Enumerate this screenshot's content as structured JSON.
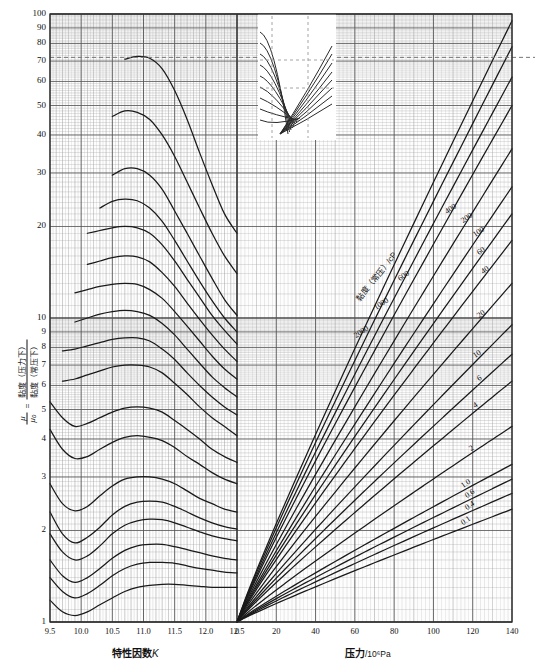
{
  "figure": {
    "kind": "nomograph",
    "background": "#ffffff",
    "grid_color": "#9a9a9a",
    "major_grid_color": "#555555",
    "curve_color": "#1a1a1a",
    "dashed_color": "#777777"
  },
  "axes": {
    "y": {
      "title_mu": "μ",
      "title_mu0": "μ₀",
      "title_num": "黏度（压力下）",
      "title_den": "黏度（常压下）",
      "scale": "log",
      "min": 1,
      "max": 100,
      "ticks": [
        "1",
        "2",
        "3",
        "4",
        "5",
        "6",
        "7",
        "8",
        "9",
        "10",
        "20",
        "30",
        "40",
        "50",
        "60",
        "70",
        "80",
        "90",
        "100"
      ]
    },
    "x_left": {
      "title": "特性因数",
      "title_symbol": "K",
      "scale": "linear",
      "min": 9.5,
      "max": 12.5,
      "ticks": [
        "9.5",
        "10.0",
        "10.5",
        "11.0",
        "11.5",
        "12.0",
        "12.5"
      ]
    },
    "x_right": {
      "title": "压力",
      "title_unit": "/10⁶Pa",
      "scale": "linear",
      "min": 0,
      "max": 140,
      "ticks": [
        "0",
        "20",
        "40",
        "60",
        "80",
        "100",
        "120",
        "140"
      ]
    }
  },
  "annotations": {
    "right_panel_family_label": "黏度（常压）/cP",
    "guide_line_value": "72"
  },
  "chart_data": {
    "type": "line",
    "title": "",
    "xlabel": "特性因数K  |  压力/10⁶Pa",
    "ylabel": "μ/μ₀ = 黏度（压力下）/黏度（常压下）",
    "ylim": [
      1,
      100
    ],
    "grid": true,
    "legend_position": "inline-curve-labels",
    "panels": [
      {
        "name": "left-panel-characterization-factor",
        "xlabel": "特性因数K",
        "xlim": [
          9.5,
          12.5
        ],
        "x": [
          9.5,
          9.7,
          9.9,
          10.1,
          10.3,
          10.5,
          10.7,
          10.9,
          11.1,
          11.3,
          11.5,
          11.7,
          11.9,
          12.1,
          12.3,
          12.5
        ],
        "series": [
          {
            "name": "c1",
            "values": [
              null,
              null,
              null,
              null,
              null,
              null,
              71.0,
              72.5,
              71.5,
              66.0,
              56.0,
              45.0,
              35.0,
              27.5,
              22.0,
              19.0
            ]
          },
          {
            "name": "c2",
            "values": [
              null,
              null,
              null,
              null,
              null,
              46.0,
              48.0,
              47.5,
              45.0,
              40.0,
              34.0,
              28.0,
              23.0,
              19.0,
              16.0,
              14.0
            ]
          },
          {
            "name": "c3",
            "values": [
              null,
              null,
              null,
              null,
              null,
              29.5,
              31.0,
              31.0,
              29.5,
              26.5,
              22.5,
              19.0,
              16.0,
              13.5,
              11.5,
              10.2
            ]
          },
          {
            "name": "c4",
            "values": [
              null,
              null,
              null,
              null,
              23.0,
              24.2,
              24.6,
              24.3,
              23.0,
              20.8,
              18.0,
              15.4,
              13.2,
              11.4,
              10.0,
              9.0
            ]
          },
          {
            "name": "c5",
            "values": [
              null,
              null,
              null,
              19.0,
              19.4,
              19.8,
              20.0,
              19.8,
              19.0,
              17.4,
              15.4,
              13.4,
              11.7,
              10.2,
              9.1,
              8.2
            ]
          },
          {
            "name": "c6",
            "values": [
              null,
              null,
              null,
              15.0,
              15.4,
              15.8,
              16.0,
              15.9,
              15.3,
              14.1,
              12.7,
              11.2,
              9.9,
              8.8,
              7.9,
              7.2
            ]
          },
          {
            "name": "c7",
            "values": [
              null,
              null,
              12.1,
              12.4,
              12.7,
              12.9,
              13.0,
              12.9,
              12.4,
              11.6,
              10.5,
              9.4,
              8.4,
              7.5,
              6.8,
              6.3
            ]
          },
          {
            "name": "c8",
            "values": [
              null,
              null,
              9.7,
              10.0,
              10.3,
              10.5,
              10.6,
              10.5,
              10.2,
              9.6,
              8.8,
              7.9,
              7.1,
              6.4,
              5.9,
              5.5
            ]
          },
          {
            "name": "c9",
            "values": [
              null,
              7.8,
              7.9,
              8.1,
              8.3,
              8.5,
              8.6,
              8.6,
              8.4,
              7.9,
              7.3,
              6.6,
              6.0,
              5.5,
              5.1,
              4.8
            ]
          },
          {
            "name": "c10",
            "values": [
              null,
              6.2,
              6.3,
              6.5,
              6.7,
              6.9,
              7.0,
              7.0,
              6.9,
              6.6,
              6.1,
              5.6,
              5.1,
              4.7,
              4.4,
              4.1
            ]
          },
          {
            "name": "c11",
            "values": [
              5.3,
              4.7,
              4.4,
              4.5,
              4.7,
              4.9,
              5.05,
              5.1,
              5.05,
              4.9,
              4.6,
              4.3,
              4.0,
              3.7,
              3.5,
              3.35
            ]
          },
          {
            "name": "c12",
            "values": [
              4.3,
              3.7,
              3.45,
              3.5,
              3.7,
              3.9,
              4.05,
              4.1,
              4.05,
              3.95,
              3.75,
              3.5,
              3.3,
              3.1,
              2.95,
              2.85
            ]
          },
          {
            "name": "c13",
            "values": [
              2.85,
              2.45,
              2.32,
              2.4,
              2.6,
              2.8,
              2.95,
              3.0,
              3.0,
              2.95,
              2.85,
              2.7,
              2.55,
              2.45,
              2.35,
              2.3
            ]
          },
          {
            "name": "c14",
            "values": [
              2.3,
              1.95,
              1.82,
              1.9,
              2.05,
              2.25,
              2.4,
              2.48,
              2.5,
              2.48,
              2.4,
              2.3,
              2.2,
              2.12,
              2.06,
              2.02
            ]
          },
          {
            "name": "c15",
            "values": [
              1.95,
              1.7,
              1.6,
              1.65,
              1.78,
              1.95,
              2.08,
              2.15,
              2.18,
              2.17,
              2.12,
              2.05,
              1.98,
              1.92,
              1.88,
              1.85
            ]
          },
          {
            "name": "c16",
            "values": [
              1.6,
              1.42,
              1.35,
              1.4,
              1.5,
              1.62,
              1.72,
              1.78,
              1.8,
              1.8,
              1.77,
              1.73,
              1.69,
              1.65,
              1.62,
              1.6
            ]
          },
          {
            "name": "c17",
            "values": [
              1.4,
              1.26,
              1.2,
              1.24,
              1.32,
              1.42,
              1.5,
              1.55,
              1.57,
              1.57,
              1.56,
              1.53,
              1.5,
              1.48,
              1.46,
              1.45
            ]
          },
          {
            "name": "c18",
            "values": [
              1.18,
              1.08,
              1.05,
              1.08,
              1.14,
              1.2,
              1.26,
              1.3,
              1.32,
              1.33,
              1.33,
              1.32,
              1.31,
              1.3,
              1.3,
              1.3
            ]
          }
        ]
      },
      {
        "name": "right-panel-pressure",
        "xlabel": "压力/10⁶Pa",
        "xlim": [
          0,
          140
        ],
        "family_label": "黏度（常压）/cP",
        "note": "all curves start at (0 MPa, μ/μ₀ = 1)",
        "series": [
          {
            "name": "2000",
            "label": "2000",
            "value_at_140": 95.0
          },
          {
            "name": "1000",
            "label": "1000",
            "value_at_140": 78.0
          },
          {
            "name": "600",
            "label": "600",
            "value_at_140": 62.0
          },
          {
            "name": "400",
            "label": "400",
            "value_at_140": 50.0
          },
          {
            "name": "200",
            "label": "200",
            "value_at_140": 36.0
          },
          {
            "name": "100",
            "label": "100",
            "value_at_140": 27.0
          },
          {
            "name": "60",
            "label": "60",
            "value_at_140": 22.0
          },
          {
            "name": "40",
            "label": "40",
            "value_at_140": 18.0
          },
          {
            "name": "20",
            "label": "20",
            "value_at_140": 13.0
          },
          {
            "name": "10",
            "label": "10",
            "value_at_140": 9.5
          },
          {
            "name": "6",
            "label": "6",
            "value_at_140": 7.6
          },
          {
            "name": "4",
            "label": "4",
            "value_at_140": 6.2
          },
          {
            "name": "2",
            "label": "2",
            "value_at_140": 4.4
          },
          {
            "name": "1.0",
            "label": "1.0",
            "value_at_140": 3.3
          },
          {
            "name": "0.6",
            "label": "0.6",
            "value_at_140": 2.95
          },
          {
            "name": "0.4",
            "label": "0.4",
            "value_at_140": 2.65
          },
          {
            "name": "0.1",
            "label": "0.1",
            "value_at_140": 2.35
          }
        ]
      }
    ],
    "inset": {
      "name": "inset-white-overlay",
      "has_dashed_guides": true
    }
  }
}
